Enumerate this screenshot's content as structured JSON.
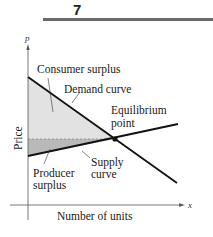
{
  "page": {
    "number": "7"
  },
  "diagram": {
    "axes": {
      "y_var": "p",
      "x_var": "x",
      "y_label": "Price",
      "x_label": "Number of units"
    },
    "labels": {
      "consumer_surplus": "Consumer surplus",
      "demand_curve": "Demand curve",
      "equilibrium_line1": "Equilibrium",
      "equilibrium_line2": "point",
      "producer_line1": "Producer",
      "producer_line2": "surplus",
      "supply_line1": "Supply",
      "supply_line2": "curve"
    },
    "colors": {
      "consumer_surplus_fill": "#e2e2e2",
      "producer_surplus_fill": "#b9b9b9",
      "curve": "#111111",
      "axis": "#555555"
    }
  }
}
